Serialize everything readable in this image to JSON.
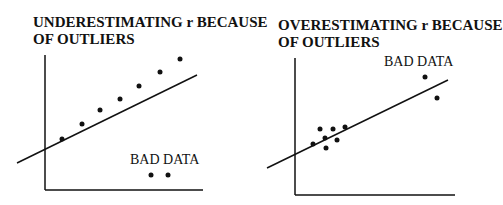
{
  "panels": [
    {
      "title_line1": "UNDERESTIMATING r BECAUSE",
      "title_line2": "OF OUTLIERS",
      "outlier_label": "BAD DATA"
    },
    {
      "title_line1": "OVERESTIMATING r BECAUSE",
      "title_line2": "OF OUTLIERS",
      "outlier_label": "BAD DATA"
    }
  ],
  "colors": {
    "ink": "#111111",
    "background": "#ffffff"
  }
}
